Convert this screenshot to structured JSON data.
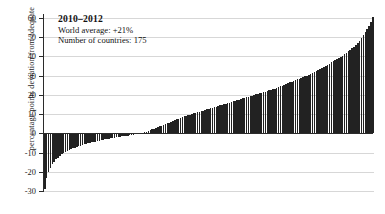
{
  "chart_data": {
    "type": "bar",
    "title": "2010–2012",
    "subtitle_lines": [
      "World average: +21%",
      "Number of countries: 175"
    ],
    "xlabel": "",
    "ylabel": "percentage points deviation from adequate",
    "ylim": [
      -30,
      62
    ],
    "yticks": [
      60,
      50,
      40,
      30,
      20,
      10,
      0,
      -10,
      -20,
      -30
    ],
    "ytick_labels": [
      "60",
      "50",
      "40",
      "30",
      "20",
      "10",
      "0",
      "-10",
      "-20",
      "-30"
    ],
    "grid": true,
    "legend": "none",
    "bar_color": "#222222",
    "zero_line": 0,
    "n_countries": 175,
    "world_average": 21,
    "series_name": "deviation from adequate",
    "values": [
      -29.0,
      -23.5,
      -20.2,
      -18.0,
      -16.2,
      -14.8,
      -13.6,
      -12.6,
      -11.7,
      -11.0,
      -10.4,
      -9.8,
      -9.2,
      -8.7,
      -8.2,
      -7.8,
      -7.4,
      -7.0,
      -6.7,
      -6.4,
      -6.1,
      -5.8,
      -5.5,
      -5.2,
      -5.0,
      -4.7,
      -4.5,
      -4.3,
      -4.0,
      -3.8,
      -3.6,
      -3.4,
      -3.2,
      -3.0,
      -2.8,
      -2.6,
      -2.5,
      -2.3,
      -2.1,
      -2.0,
      -1.8,
      -1.6,
      -1.5,
      -1.3,
      -1.2,
      -1.0,
      -0.9,
      -0.7,
      -0.6,
      -0.4,
      -0.3,
      -0.1,
      0.2,
      0.5,
      0.8,
      1.2,
      1.6,
      2.0,
      2.4,
      2.8,
      3.2,
      3.6,
      4.0,
      4.4,
      4.8,
      5.2,
      5.6,
      6.0,
      6.4,
      6.8,
      7.2,
      7.6,
      8.0,
      8.4,
      8.8,
      9.1,
      9.4,
      9.7,
      10.0,
      10.3,
      10.6,
      10.9,
      11.2,
      11.5,
      11.8,
      12.1,
      12.4,
      12.7,
      13.0,
      13.3,
      13.6,
      13.9,
      14.2,
      14.5,
      14.8,
      15.1,
      15.4,
      15.7,
      16.0,
      16.3,
      16.6,
      16.9,
      17.2,
      17.5,
      17.8,
      18.1,
      18.4,
      18.7,
      19.0,
      19.3,
      19.6,
      19.9,
      20.2,
      20.5,
      20.8,
      21.1,
      21.4,
      21.7,
      22.0,
      22.3,
      22.6,
      22.9,
      23.2,
      23.6,
      24.0,
      24.4,
      24.8,
      25.2,
      25.6,
      26.0,
      26.4,
      26.8,
      27.2,
      27.6,
      28.0,
      28.4,
      28.8,
      29.2,
      29.6,
      30.0,
      30.5,
      31.0,
      31.5,
      32.0,
      32.5,
      33.0,
      33.5,
      34.0,
      34.5,
      35.0,
      35.6,
      36.2,
      36.8,
      37.4,
      38.0,
      38.6,
      39.2,
      39.8,
      40.4,
      41.0,
      41.8,
      42.6,
      43.4,
      44.2,
      45.0,
      46.0,
      47.0,
      48.2,
      49.5,
      51.0,
      52.5,
      54.0,
      56.0,
      58.0,
      60.5
    ]
  }
}
